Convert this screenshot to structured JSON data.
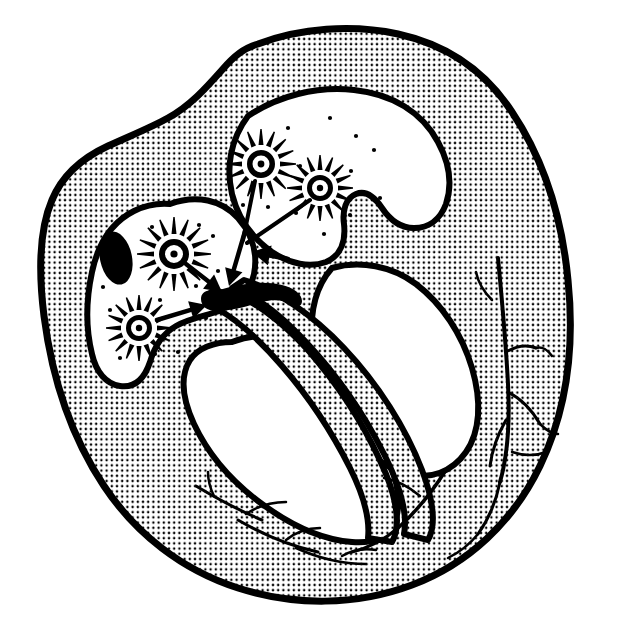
{
  "figure": {
    "kind": "anatomical-line-drawing",
    "caption": "",
    "background_color": "#ffffff",
    "ink_color": "#000000",
    "stipple_color": "#000000",
    "stipple_pitch_px": 5.2,
    "stipple_dot_radius_px": 1.25,
    "outline_stroke_px": 7
  },
  "structures": {
    "myocardium_wall": {
      "name": "myocardium-wall",
      "fill": "stipple",
      "outline": "#000000"
    },
    "left_atrium_chamber": {
      "name": "left-atrium-chamber",
      "fill": "#ffffff"
    },
    "right_atrium_chamber": {
      "name": "right-atrium-chamber",
      "fill": "#ffffff"
    },
    "left_ventricle_chamber": {
      "name": "left-ventricle-chamber",
      "fill": "#ffffff"
    },
    "right_ventricle_chamber": {
      "name": "right-ventricle-chamber",
      "fill": "#ffffff"
    },
    "interventricular_septum": {
      "name": "interventricular-septum",
      "fill": "stipple"
    },
    "vein_ostium": {
      "name": "vein-ostium-oval",
      "fill": "#000000",
      "cx": 116,
      "cy": 258,
      "rx": 16,
      "ry": 27,
      "rotation_deg": -12
    },
    "av_node": {
      "name": "av-node",
      "fill": "#000000",
      "description": "solid black bulb where arrows converge"
    }
  },
  "ectopic_foci": [
    {
      "id": "focus-left-upper",
      "cx": 174,
      "cy": 254,
      "ring_outer_r": 15,
      "ring_inner_r": 9,
      "core_r": 3.6,
      "ray_count": 16,
      "ray_inner": 20,
      "ray_outer": 37
    },
    {
      "id": "focus-left-lower",
      "cx": 139,
      "cy": 328,
      "ring_outer_r": 13,
      "ring_inner_r": 8,
      "core_r": 3.2,
      "ray_count": 16,
      "ray_inner": 18,
      "ray_outer": 33
    },
    {
      "id": "focus-right-upper",
      "cx": 261,
      "cy": 164,
      "ring_outer_r": 14,
      "ring_inner_r": 8.5,
      "core_r": 3.4,
      "ray_count": 16,
      "ray_inner": 19,
      "ray_outer": 35
    },
    {
      "id": "focus-right-lower",
      "cx": 320,
      "cy": 188,
      "ring_outer_r": 13,
      "ring_inner_r": 8,
      "core_r": 3.2,
      "ray_count": 16,
      "ray_inner": 18,
      "ray_outer": 33
    }
  ],
  "impulse_arrows": [
    {
      "id": "arrow-left-upper-to-node",
      "x1": 186,
      "y1": 264,
      "x2": 222,
      "y2": 292,
      "head_len": 17,
      "head_w": 9
    },
    {
      "id": "arrow-left-lower-to-node",
      "x1": 157,
      "y1": 320,
      "x2": 207,
      "y2": 305,
      "head_len": 17,
      "head_w": 9
    },
    {
      "id": "arrow-down-to-node",
      "x1": 246,
      "y1": 228,
      "x2": 229,
      "y2": 286,
      "head_len": 17,
      "head_w": 9
    },
    {
      "id": "arrow-septal-leftward",
      "x1": 288,
      "y1": 259,
      "x2": 252,
      "y2": 252,
      "head_len": 18,
      "head_w": 10
    }
  ],
  "focus_leads": [
    {
      "id": "lead-right-upper",
      "x1": 255,
      "y1": 181,
      "x2": 243,
      "y2": 240
    },
    {
      "id": "lead-right-lower",
      "x1": 310,
      "y1": 200,
      "x2": 247,
      "y2": 243
    }
  ],
  "conduction_fibers": {
    "name": "branching-conduction-fibers",
    "branches": [
      "right-wall-upper-branch",
      "right-wall-mid-branch",
      "right-wall-lower-branch",
      "apex-branch",
      "inferior-wall-branch-1",
      "inferior-wall-branch-2",
      "inferior-wall-branch-3"
    ]
  },
  "speckles": [
    [
      288,
      128
    ],
    [
      330,
      118
    ],
    [
      356,
      136
    ],
    [
      300,
      166
    ],
    [
      351,
      171
    ],
    [
      374,
      150
    ],
    [
      296,
      213
    ],
    [
      350,
      215
    ],
    [
      380,
      198
    ],
    [
      243,
      205
    ],
    [
      268,
      207
    ],
    [
      213,
      236
    ],
    [
      152,
      227
    ],
    [
      199,
      225
    ],
    [
      160,
      300
    ],
    [
      196,
      286
    ],
    [
      110,
      310
    ],
    [
      178,
      352
    ],
    [
      120,
      358
    ],
    [
      155,
      354
    ],
    [
      206,
      318
    ],
    [
      103,
      287
    ],
    [
      218,
      271
    ],
    [
      324,
      234
    ]
  ]
}
